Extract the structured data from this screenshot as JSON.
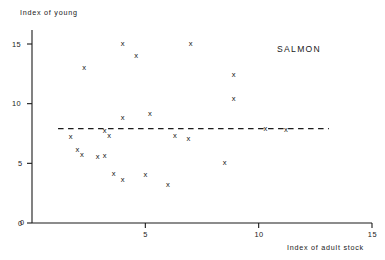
{
  "chart_data": {
    "type": "scatter",
    "title": "",
    "annotation": "SALMON",
    "xlabel": "Index of adult stock",
    "ylabel": "Index of young",
    "xlim": [
      0,
      15
    ],
    "ylim": [
      0,
      16.1
    ],
    "xticks": [
      0,
      5,
      10,
      15
    ],
    "xticklabels": [
      "0",
      "5",
      "10",
      "15"
    ],
    "yticks": [
      0,
      5,
      10,
      15
    ],
    "yticklabels": [
      "0",
      "5",
      "10",
      "15"
    ],
    "grid": false,
    "legend": "none",
    "marker": "x",
    "reference_line": {
      "type": "horizontal-dashed",
      "y": 7.9,
      "x_start": 1.15,
      "x_end": 13.1
    },
    "points": [
      {
        "x": 2.3,
        "y": 13.0
      },
      {
        "x": 4.0,
        "y": 15.0
      },
      {
        "x": 4.6,
        "y": 14.0
      },
      {
        "x": 7.0,
        "y": 15.0
      },
      {
        "x": 8.9,
        "y": 12.4
      },
      {
        "x": 8.9,
        "y": 10.4
      },
      {
        "x": 4.0,
        "y": 8.8
      },
      {
        "x": 5.2,
        "y": 9.1
      },
      {
        "x": 1.7,
        "y": 7.2
      },
      {
        "x": 3.2,
        "y": 7.7
      },
      {
        "x": 3.4,
        "y": 7.3
      },
      {
        "x": 6.3,
        "y": 7.3
      },
      {
        "x": 6.9,
        "y": 7.0
      },
      {
        "x": 10.3,
        "y": 7.9
      },
      {
        "x": 11.2,
        "y": 7.8
      },
      {
        "x": 2.0,
        "y": 6.1
      },
      {
        "x": 2.2,
        "y": 5.7
      },
      {
        "x": 2.9,
        "y": 5.5
      },
      {
        "x": 3.2,
        "y": 5.6
      },
      {
        "x": 3.6,
        "y": 4.1
      },
      {
        "x": 4.0,
        "y": 3.6
      },
      {
        "x": 5.0,
        "y": 4.0
      },
      {
        "x": 6.0,
        "y": 3.2
      },
      {
        "x": 8.5,
        "y": 5.0
      }
    ]
  }
}
